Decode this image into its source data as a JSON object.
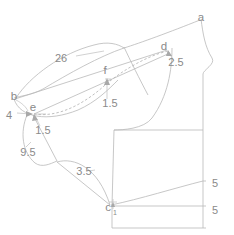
{
  "diagram": {
    "type": "technical-line-drawing",
    "stroke_color": "#b9b9b9",
    "label_color": "#8a8a8a",
    "background": "#ffffff",
    "width": 234,
    "height": 235
  },
  "points": [
    {
      "id": "a",
      "label": "a",
      "x": 201,
      "y": 18
    },
    {
      "id": "d",
      "label": "d",
      "x": 164,
      "y": 47
    },
    {
      "id": "f",
      "label": "f",
      "x": 105,
      "y": 76
    },
    {
      "id": "b",
      "label": "b",
      "x": 14,
      "y": 97
    },
    {
      "id": "e",
      "label": "e",
      "x": 33,
      "y": 113
    },
    {
      "id": "c",
      "label": "c",
      "x": 110,
      "y": 206
    }
  ],
  "measurements": [
    {
      "id": "m26",
      "value": "26",
      "x": 61,
      "y": 59
    },
    {
      "id": "m25",
      "value": "2.5",
      "x": 176,
      "y": 63
    },
    {
      "id": "m15f",
      "value": "1.5",
      "x": 110,
      "y": 104
    },
    {
      "id": "m4",
      "value": "4",
      "x": 9,
      "y": 116
    },
    {
      "id": "m15e",
      "value": "1.5",
      "x": 43,
      "y": 131
    },
    {
      "id": "m95",
      "value": "9.5",
      "x": 28,
      "y": 153
    },
    {
      "id": "m35",
      "value": "3.5",
      "x": 84,
      "y": 172
    },
    {
      "id": "m1",
      "value": "1",
      "x": 115,
      "y": 213
    },
    {
      "id": "m5a",
      "value": "5",
      "x": 215,
      "y": 184
    },
    {
      "id": "m5b",
      "value": "5",
      "x": 215,
      "y": 211
    }
  ],
  "legend": {
    "units_note": "",
    "caption": ""
  }
}
